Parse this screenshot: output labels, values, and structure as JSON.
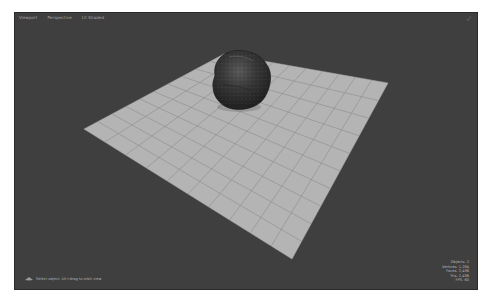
{
  "viewport": {
    "menu": [
      {
        "label": "Viewport"
      },
      {
        "label": "Perspective"
      },
      {
        "label": "Lit Shaded"
      }
    ],
    "corner_icon": "maximize-icon",
    "stats": [
      {
        "label": "Objects: 2"
      },
      {
        "label": "Vertices: 1,284"
      },
      {
        "label": "Faces: 2,436"
      },
      {
        "label": "Tris: 2,436"
      },
      {
        "label": "FPS: 60"
      }
    ],
    "status": {
      "icon": "axis-gizmo-icon",
      "text": "Select object. Alt+drag to orbit view"
    }
  },
  "scene": {
    "background_color": "#3f3f3f",
    "grid_plane": {
      "color": "#b4b4b4",
      "line_color": "#8c8c8c",
      "divisions": 10,
      "corners": {
        "left": [
          69,
          116
        ],
        "top": [
          209,
          41
        ],
        "right": [
          373,
          70
        ],
        "bottom": [
          277,
          246
        ]
      }
    },
    "rock": {
      "name": "rock",
      "color": "#2e2e2e"
    }
  }
}
